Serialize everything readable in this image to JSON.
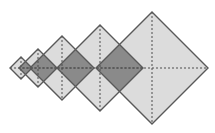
{
  "figure": {
    "type": "geometric-diagram",
    "canvas": {
      "width": 215,
      "height": 133,
      "background": "#ffffff"
    },
    "axis_y": 68,
    "style": {
      "fill_light": "#dcdcdc",
      "fill_overlap": "#8a8a8a",
      "stroke": "#595959",
      "stroke_width": 1.4,
      "axis_stroke": "#4d4d4d",
      "axis_width": 1,
      "axis_dash": "2,2"
    },
    "shapes": [
      {
        "name": "diamond-1",
        "cx": 21,
        "cy": 68,
        "r": 11,
        "fill": "#dcdcdc"
      },
      {
        "name": "diamond-2",
        "cx": 38,
        "cy": 68,
        "r": 19,
        "fill": "#dcdcdc"
      },
      {
        "name": "diamond-3",
        "cx": 62,
        "cy": 68,
        "r": 32,
        "fill": "#dcdcdc"
      },
      {
        "name": "diamond-4",
        "cx": 100,
        "cy": 68,
        "r": 43,
        "fill": "#dcdcdc"
      },
      {
        "name": "diamond-5",
        "cx": 152,
        "cy": 68,
        "r": 56,
        "fill": "#dcdcdc"
      }
    ],
    "overlaps": [
      {
        "name": "overlap-1-2",
        "between": [
          1,
          2
        ],
        "fill": "#8a8a8a"
      },
      {
        "name": "overlap-2-3",
        "between": [
          2,
          3
        ],
        "fill": "#8a8a8a"
      },
      {
        "name": "overlap-3-4",
        "between": [
          3,
          4
        ],
        "fill": "#8a8a8a"
      },
      {
        "name": "overlap-4-5",
        "between": [
          4,
          5
        ],
        "fill": "#8a8a8a"
      }
    ],
    "labels": []
  }
}
